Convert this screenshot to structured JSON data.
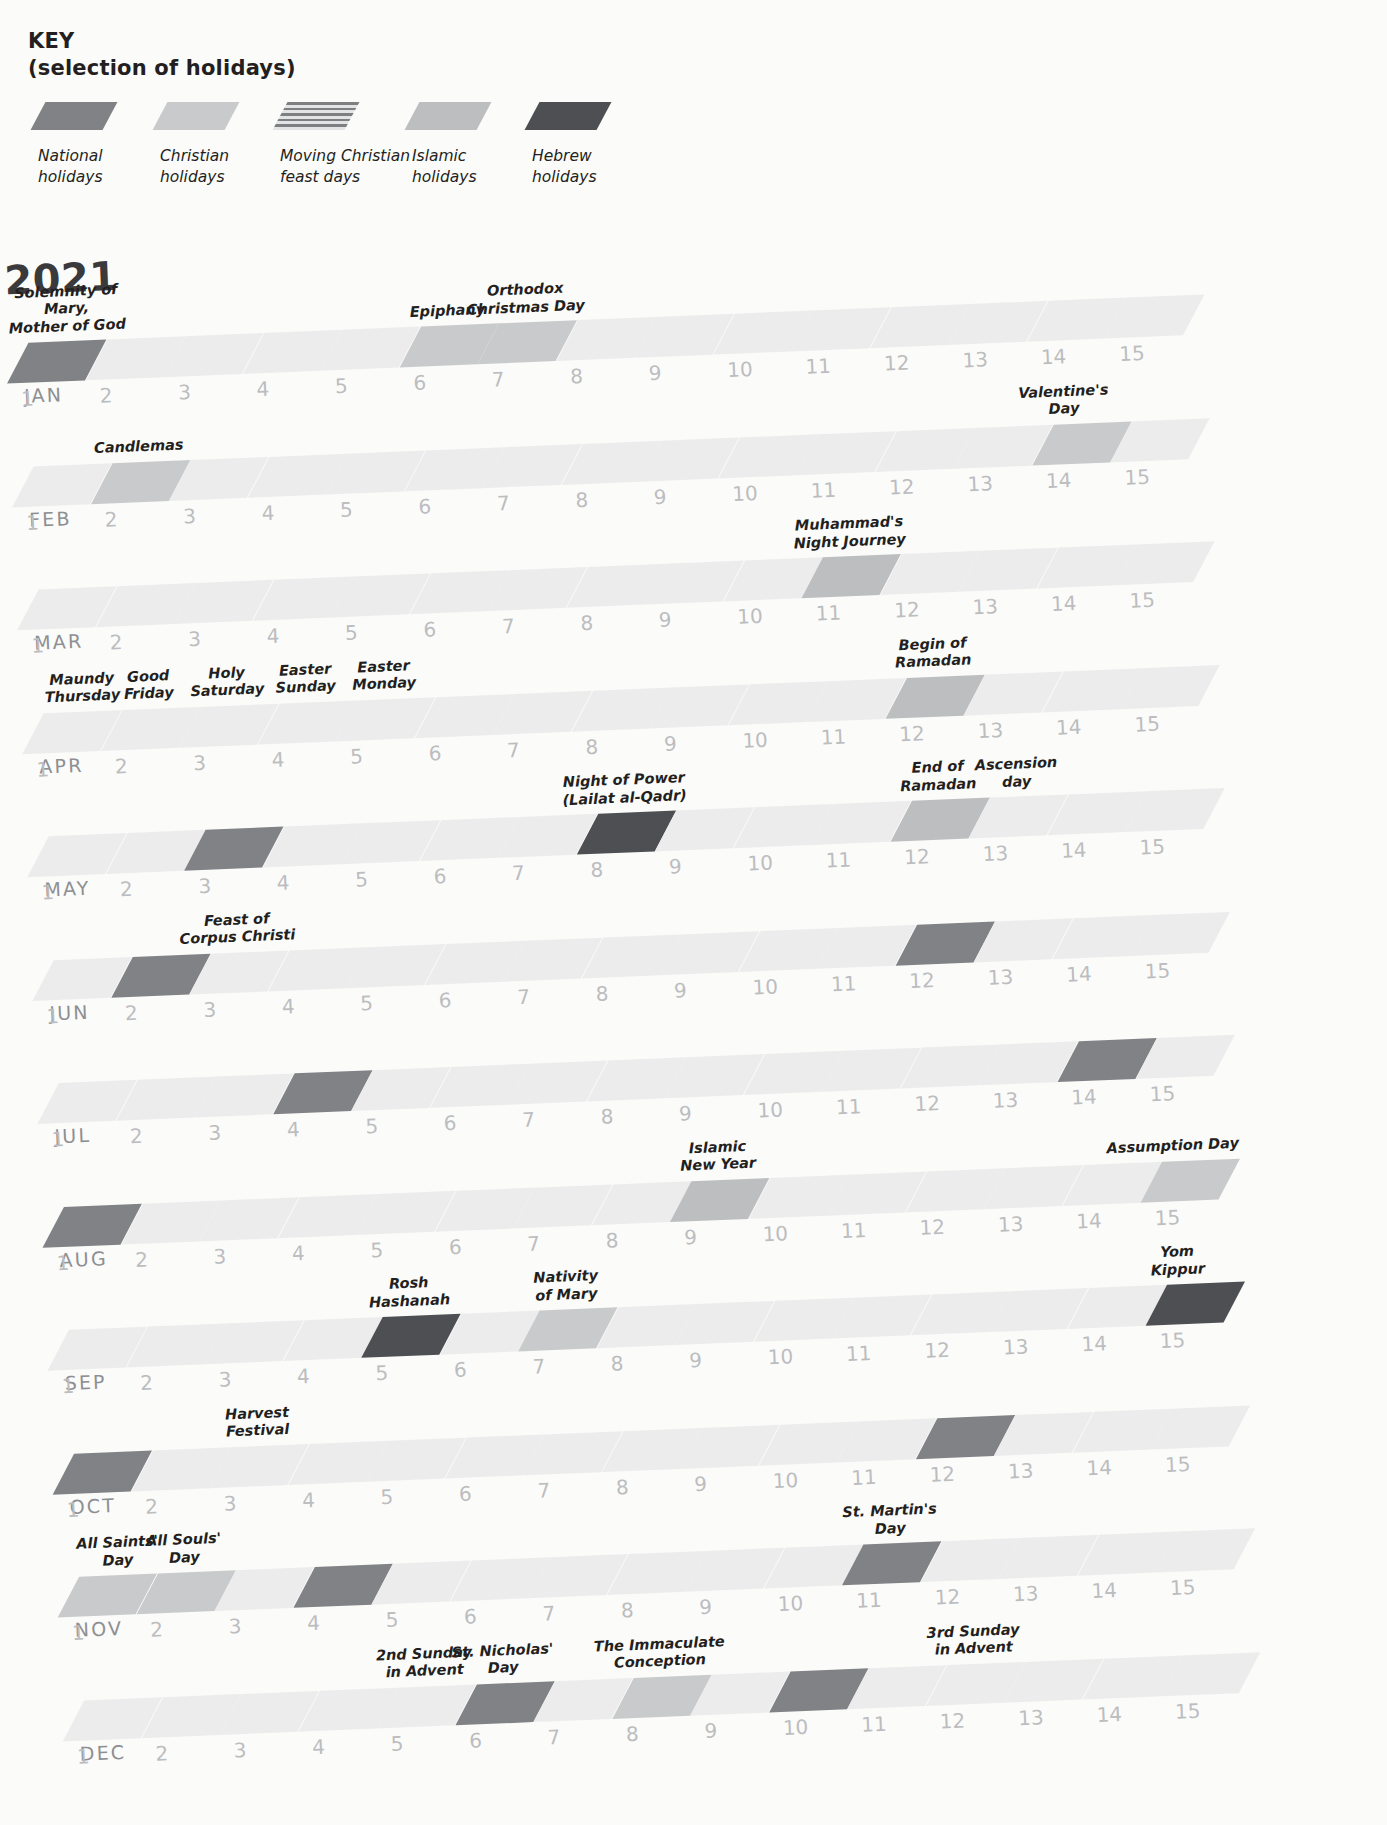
{
  "key": {
    "title_line1": "KEY",
    "title_line2": "(selection of holidays)",
    "items": [
      {
        "label": "National\nholidays",
        "color": "#808285",
        "pattern": "solid"
      },
      {
        "label": "Christian\nholidays",
        "color": "#c9cacb",
        "pattern": "solid"
      },
      {
        "label": "Moving Christian\nfeast days",
        "color": "#8b8d8f",
        "pattern": "hatch"
      },
      {
        "label": "Islamic\nholidays",
        "color": "#bcbec0",
        "pattern": "solid"
      },
      {
        "label": "Hebrew\nholidays",
        "color": "#4d4f52",
        "pattern": "solid"
      }
    ]
  },
  "year": "2021",
  "palette": {
    "empty": "#ececec",
    "national": "#808285",
    "christian": "#c9cacb",
    "moving_christian": "#8b8d8f",
    "islamic": "#bcbec0",
    "hebrew": "#4d4f52",
    "daynum": "#bcbdbf",
    "monthname": "#8d8f92",
    "text": "#231f20"
  },
  "chart_data": {
    "type": "table",
    "title": "2021",
    "xlabel": "Day of month",
    "ylabel": "Month",
    "categories": [
      "1",
      "2",
      "3",
      "4",
      "5",
      "6",
      "7",
      "8",
      "9",
      "10",
      "11",
      "12",
      "13",
      "14",
      "15"
    ],
    "legend": [
      "National holidays",
      "Christian holidays",
      "Moving Christian feast days",
      "Islamic holidays",
      "Hebrew holidays"
    ]
  },
  "days": [
    "1",
    "2",
    "3",
    "4",
    "5",
    "6",
    "7",
    "8",
    "9",
    "10",
    "11",
    "12",
    "13",
    "14",
    "15"
  ],
  "months": [
    {
      "name": "JAN",
      "marks": [
        {
          "day": 1,
          "type": "national",
          "label": "Solemnity of Mary,\nMother of God"
        },
        {
          "day": 6,
          "type": "christian",
          "label": "Epiphany"
        },
        {
          "day": 7,
          "type": "christian",
          "label": "Orthodox\nChristmas Day"
        }
      ]
    },
    {
      "name": "FEB",
      "marks": [
        {
          "day": 14,
          "type": "christian",
          "label": "Valentine's\nDay"
        },
        {
          "day": 2,
          "type": "christian",
          "label": "Candlemas"
        }
      ]
    },
    {
      "name": "MAR",
      "marks": [
        {
          "day": 11,
          "type": "islamic",
          "label": "Muhammad's\nNight Journey"
        }
      ]
    },
    {
      "name": "APR",
      "marks": [
        {
          "day": 12,
          "type": "islamic",
          "label": "Begin of\nRamadan"
        },
        {
          "day": 1,
          "type": "moving_christian",
          "label": "Maundy\nThursday"
        },
        {
          "day": 2,
          "type": "moving_christian",
          "label": "Good\nFriday"
        },
        {
          "day": 3,
          "type": "moving_christian",
          "label": "Holy\nSaturday"
        },
        {
          "day": 4,
          "type": "moving_christian",
          "label": "Easter\nSunday"
        },
        {
          "day": 5,
          "type": "moving_christian",
          "label": "Easter\nMonday"
        }
      ]
    },
    {
      "name": "MAY",
      "marks": [
        {
          "day": 8,
          "type": "hebrew",
          "label": "Night of Power\n(Lailat al-Qadr)"
        },
        {
          "day": 12,
          "type": "islamic",
          "label": "End of\nRamadan"
        },
        {
          "day": 13,
          "type": "moving_christian",
          "label": "Ascension\nday"
        },
        {
          "day": 3,
          "type": "national",
          "label": ""
        }
      ]
    },
    {
      "name": "JUN",
      "marks": [
        {
          "day": 12,
          "type": "national",
          "label": ""
        },
        {
          "day": 2,
          "type": "national",
          "label": ""
        },
        {
          "day": 3,
          "type": "moving_christian",
          "label": "Feast of\nCorpus Christi"
        }
      ]
    },
    {
      "name": "JUL",
      "marks": [
        {
          "day": 14,
          "type": "national",
          "label": ""
        },
        {
          "day": 4,
          "type": "national",
          "label": ""
        }
      ]
    },
    {
      "name": "AUG",
      "marks": [
        {
          "day": 9,
          "type": "islamic",
          "label": "Islamic\nNew Year"
        },
        {
          "day": 15,
          "type": "christian",
          "label": "Assumption Day"
        },
        {
          "day": 1,
          "type": "national",
          "label": ""
        }
      ]
    },
    {
      "name": "SEP",
      "marks": [
        {
          "day": 15,
          "type": "hebrew",
          "label": "Yom\nKippur"
        },
        {
          "day": 5,
          "type": "hebrew",
          "label": "Rosh\nHashanah"
        },
        {
          "day": 7,
          "type": "christian",
          "label": "Nativity\nof Mary"
        }
      ]
    },
    {
      "name": "OCT",
      "marks": [
        {
          "day": 12,
          "type": "national",
          "label": ""
        },
        {
          "day": 1,
          "type": "national",
          "label": ""
        },
        {
          "day": 3,
          "type": "moving_christian",
          "label": "Harvest\nFestival"
        }
      ]
    },
    {
      "name": "NOV",
      "marks": [
        {
          "day": 11,
          "type": "national",
          "label": "St. Martin's\nDay"
        },
        {
          "day": 1,
          "type": "christian",
          "label": "All Saints'\nDay"
        },
        {
          "day": 2,
          "type": "christian",
          "label": "All Souls'\nDay"
        },
        {
          "day": 4,
          "type": "national",
          "label": ""
        }
      ]
    },
    {
      "name": "DEC",
      "marks": [
        {
          "day": 5,
          "type": "moving_christian",
          "label": "2nd Sunday\nin Advent"
        },
        {
          "day": 6,
          "type": "national",
          "label": "St. Nicholas'\nDay"
        },
        {
          "day": 8,
          "type": "christian",
          "label": "The Immaculate\nConception"
        },
        {
          "day": 10,
          "type": "national",
          "label": ""
        },
        {
          "day": 12,
          "type": "moving_christian",
          "label": "3rd Sunday\nin Advent"
        }
      ]
    }
  ]
}
